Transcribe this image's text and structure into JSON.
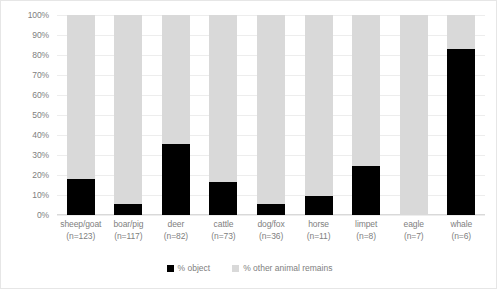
{
  "chart_data": {
    "type": "bar",
    "subtype": "stacked-percentage-column",
    "title": "",
    "xlabel": "",
    "ylabel": "",
    "ylim": [
      0,
      100
    ],
    "yticks": [
      "0%",
      "10%",
      "20%",
      "30%",
      "40%",
      "50%",
      "60%",
      "70%",
      "80%",
      "90%",
      "100%"
    ],
    "ytick_values": [
      0,
      10,
      20,
      30,
      40,
      50,
      60,
      70,
      80,
      90,
      100
    ],
    "grid": true,
    "legend_position": "bottom-center",
    "categories": [
      "sheep/goat",
      "boar/pig",
      "deer",
      "cattle",
      "dog/fox",
      "horse",
      "limpet",
      "eagle",
      "whale"
    ],
    "category_counts": [
      "(n=123)",
      "(n=117)",
      "(n=82)",
      "(n=73)",
      "(n=36)",
      "(n=11)",
      "(n=8)",
      "(n=7)",
      "(n=6)"
    ],
    "series": [
      {
        "name": "% object",
        "color": "#000000",
        "values": [
          18,
          5.5,
          35.5,
          16.5,
          5.5,
          9.5,
          24.5,
          0,
          83
        ]
      },
      {
        "name": "% other animal remains",
        "color": "#d9d9d9",
        "values": [
          82,
          94.5,
          64.5,
          83.5,
          94.5,
          90.5,
          75.5,
          100,
          17
        ]
      }
    ]
  },
  "colors": {
    "object": "#000000",
    "other": "#d9d9d9",
    "gridline": "#ededed",
    "text": "#808080",
    "border": "#e6e6e6"
  }
}
